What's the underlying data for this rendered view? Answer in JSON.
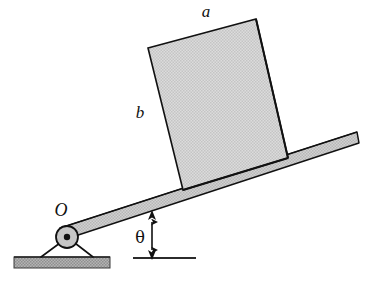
{
  "figure": {
    "labels": {
      "block_top_edge": "a",
      "block_left_edge": "b",
      "pivot": "O",
      "angle": "θ"
    },
    "colors": {
      "block_fill": "#d6d6d6",
      "bar_fill": "#c9c9c9",
      "ground_fill": "#a8a8a8",
      "pivot_fill": "#bdbdbd",
      "outline": "#111111",
      "background": "#ffffff"
    },
    "geometry": {
      "incline_angle_deg": 18,
      "block": {
        "top_left": [
          148,
          48
        ],
        "top_right": [
          256,
          19
        ],
        "bottom_right": [
          288,
          158
        ],
        "bottom_left": [
          183,
          190
        ]
      },
      "bar": {
        "pivot_end": [
          62,
          236
        ],
        "far_end": [
          359,
          140
        ],
        "thickness": 12
      },
      "pivot": {
        "center": [
          67,
          237
        ],
        "outer_radius": 11,
        "inner_radius": 3
      },
      "ground": {
        "x": 14,
        "y": 257,
        "width": 96,
        "height": 11
      },
      "support_legs": [
        {
          "from": [
            67,
            237
          ],
          "to": [
            41,
            257
          ]
        },
        {
          "from": [
            67,
            237
          ],
          "to": [
            93,
            257
          ]
        }
      ],
      "reference_line": {
        "x1": 133,
        "y1": 258,
        "x2": 196,
        "y2": 258
      },
      "angle_arrow": {
        "x": 152,
        "y_top": 212,
        "y_bottom": 257
      }
    }
  }
}
